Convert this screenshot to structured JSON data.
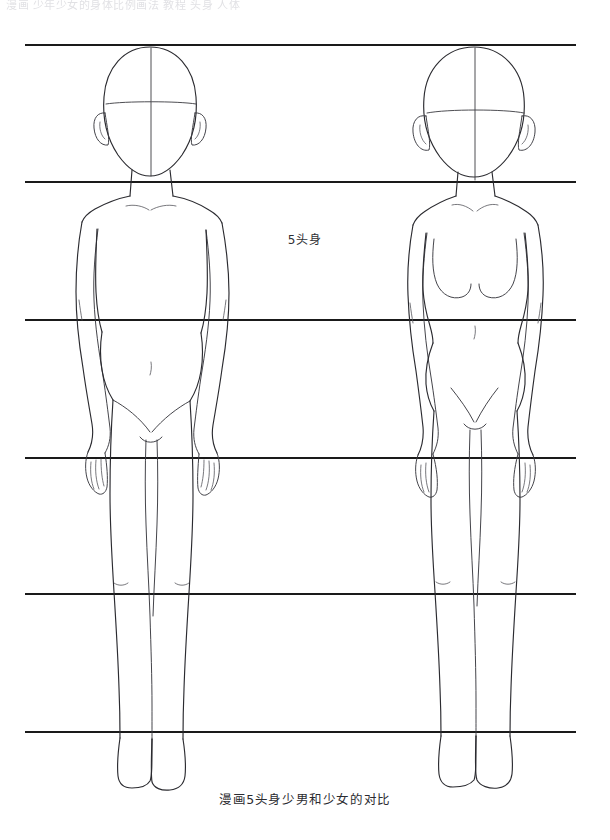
{
  "page": {
    "width": 610,
    "height": 840,
    "background_color": "#ffffff",
    "ink_color": "#2b2b30",
    "guide_color": "#1a1a1a"
  },
  "header": {
    "cropped_text": "漫画 少年少女的身体比例画法 教程 头身 人体",
    "note_visible": "faded cropped text strip at top edge"
  },
  "center_label": {
    "text": "5头身"
  },
  "caption": {
    "text": "漫画5头身少男和少女的对比"
  },
  "guides": {
    "label": "head-division guide lines",
    "count": 6,
    "x_start": 25,
    "x_end": 576,
    "y_positions": [
      45,
      182,
      320,
      458,
      594,
      732
    ],
    "stroke_width": 2.1
  },
  "figures": [
    {
      "id": "male",
      "label": "少男",
      "side": "left",
      "center_x": 150,
      "head_top_y": 47,
      "head_width": 90,
      "head_height": 118,
      "shoulder_width": 116,
      "proportion": "5头身",
      "traits": [
        "narrow hips",
        "straight waist",
        "flat chest",
        "angular jaw"
      ]
    },
    {
      "id": "female",
      "label": "少女",
      "side": "right",
      "center_x": 474,
      "head_top_y": 47,
      "head_width": 100,
      "head_height": 116,
      "shoulder_width": 110,
      "proportion": "5头身",
      "traits": [
        "wider hips",
        "defined waist",
        "breast curves",
        "round jaw"
      ]
    }
  ]
}
